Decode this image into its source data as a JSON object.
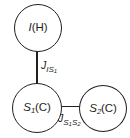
{
  "diagram": {
    "type": "spin-system-coupling-diagram",
    "background_color": "#ffffff",
    "stroke_color": "#231f20",
    "nodes": [
      {
        "id": "I",
        "label_main": "I",
        "label_subscript": "",
        "label_suffix": "(H)",
        "full_label": "I(H)",
        "nucleus": "H",
        "position": "top-left"
      },
      {
        "id": "S1",
        "label_main": "S",
        "label_subscript": "1",
        "label_suffix": "(C)",
        "full_label": "S1(C)",
        "nucleus": "C",
        "position": "bottom-left"
      },
      {
        "id": "S2",
        "label_main": "S",
        "label_subscript": "2",
        "label_suffix": "(C)",
        "full_label": "S2(C)",
        "nucleus": "C",
        "position": "bottom-right"
      }
    ],
    "edges": [
      {
        "id": "I-S1",
        "from": "I",
        "to": "S1",
        "orientation": "vertical",
        "coupling_symbol": "J",
        "coupling_sub_1": "IS",
        "coupling_sub_2": "1",
        "coupling_full": "J_IS1"
      },
      {
        "id": "S1-S2",
        "from": "S1",
        "to": "S2",
        "orientation": "horizontal",
        "coupling_symbol": "J",
        "coupling_sub_1": "S",
        "coupling_sub_1_sub": "1",
        "coupling_sub_2": "S",
        "coupling_sub_2_sub": "2",
        "coupling_full": "J_S1S2"
      }
    ]
  }
}
